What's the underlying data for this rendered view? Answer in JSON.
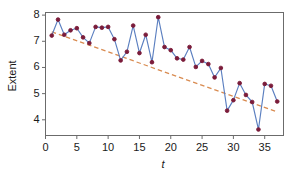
{
  "chart_data": {
    "type": "line",
    "title": "",
    "subtitle": "",
    "xlabel": "t",
    "ylabel": "Extent",
    "xlim": [
      0,
      38
    ],
    "ylim": [
      3.4,
      8.1
    ],
    "xticks": [
      0,
      5,
      10,
      15,
      20,
      25,
      30,
      35
    ],
    "yticks": [
      4,
      5,
      6,
      7,
      8
    ],
    "xtick_labels": [
      "0",
      "5",
      "10",
      "15",
      "20",
      "25",
      "30",
      "35"
    ],
    "ytick_labels": [
      "4",
      "5",
      "6",
      "7",
      "8"
    ],
    "grid": false,
    "legend": "none",
    "frame": "box",
    "x": [
      1,
      2,
      3,
      4,
      5,
      6,
      7,
      8,
      9,
      10,
      11,
      12,
      13,
      14,
      15,
      16,
      17,
      18,
      19,
      20,
      21,
      22,
      23,
      24,
      25,
      26,
      27,
      28,
      29,
      30,
      31,
      32,
      33,
      34,
      35,
      36,
      37
    ],
    "series": [
      {
        "name": "Extent",
        "style": "line-markers",
        "color": "#5b7fc0",
        "marker_color": "#7b1c3a",
        "marker": "circle",
        "values": [
          7.22,
          7.83,
          7.25,
          7.42,
          7.5,
          7.15,
          6.93,
          7.55,
          7.52,
          7.55,
          7.08,
          6.27,
          6.6,
          7.6,
          6.55,
          7.25,
          6.2,
          7.92,
          6.78,
          6.66,
          6.35,
          6.3,
          6.78,
          6.02,
          6.25,
          6.13,
          5.62,
          5.98,
          4.35,
          4.75,
          5.4,
          4.95,
          4.68,
          3.63,
          5.37,
          5.3,
          4.7
        ]
      },
      {
        "name": "Trend",
        "style": "dashed-line",
        "color": "#d98b50",
        "marker": "none",
        "fit": "linear",
        "endpoints": [
          {
            "x": 1,
            "y": 7.36
          },
          {
            "x": 37,
            "y": 4.3
          }
        ]
      }
    ]
  },
  "axes": {
    "y_label": "Extent",
    "x_label": "t"
  },
  "colors": {
    "series_line": "#5b7fc0",
    "marker_fill": "#7b1c3a",
    "trend_line": "#d98b50",
    "axis": "#6b6b6b",
    "text": "#1a1a1a",
    "background": "#ffffff"
  }
}
